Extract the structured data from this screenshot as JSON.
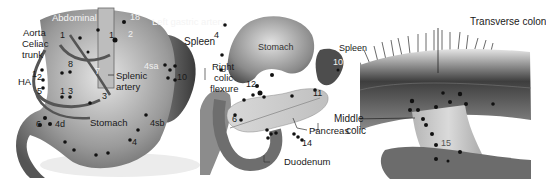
{
  "figure": {
    "panels": [
      {
        "id": "left",
        "labels": {
          "abdominal": "Abdominal",
          "left_gastric": "Left gastric artery",
          "aorta": "Aorta",
          "celiac": "Celiac",
          "trunk": "trunk",
          "spleen": "Spleen",
          "ha": "HA",
          "splenic": "Splenic",
          "artery": "artery",
          "stomach": "Stomach"
        },
        "stations": [
          "18",
          "1",
          "2",
          "1",
          "8",
          "7",
          "1",
          "2",
          "5",
          "1",
          "3",
          "3",
          "4sa",
          "10",
          "4d",
          "6",
          "4sb",
          "4"
        ]
      },
      {
        "id": "middle",
        "labels": {
          "stomach": "Stomach",
          "spleen": "Spleen",
          "right": "Right",
          "colic": "colic",
          "flexure": "flexure",
          "pancreas": "Pancreas",
          "duodenum": "Duodenum"
        },
        "stations": [
          "4",
          "12",
          "10",
          "11",
          "6",
          "14"
        ]
      },
      {
        "id": "right",
        "labels": {
          "transverse_colon": "Transverse colon",
          "middle": "Middle",
          "colic": "colic"
        },
        "stations": [
          "15"
        ]
      }
    ]
  }
}
